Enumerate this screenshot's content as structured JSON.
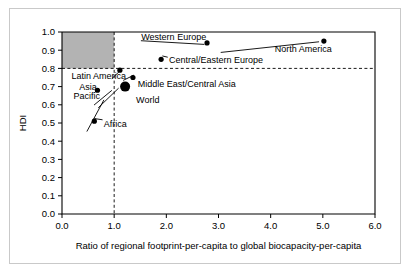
{
  "chart_data": {
    "type": "scatter",
    "title": "",
    "xlabel": "Ratio of regional footprint-per-capita to global biocapacity-per-capita",
    "ylabel": "HDI",
    "xlim": [
      0.0,
      6.0
    ],
    "ylim": [
      0.0,
      1.0
    ],
    "xticks": [
      "0.0",
      "1.0",
      "2.0",
      "3.0",
      "4.0",
      "5.0",
      "6.0"
    ],
    "xtick_values": [
      0.0,
      1.0,
      2.0,
      3.0,
      4.0,
      5.0,
      6.0
    ],
    "yticks": [
      "0.0",
      "0.1",
      "0.2",
      "0.3",
      "0.4",
      "0.5",
      "0.6",
      "0.7",
      "0.8",
      "0.9",
      "1.0"
    ],
    "ytick_values": [
      0.0,
      0.1,
      0.2,
      0.3,
      0.4,
      0.5,
      0.6,
      0.7,
      0.8,
      0.9,
      1.0
    ],
    "grid": false,
    "legend": "none",
    "annotations": {
      "shaded_region": {
        "name": "sustainable-development-quadrant",
        "x_range": [
          0.0,
          1.0
        ],
        "y_range": [
          0.8,
          1.0
        ],
        "color": "#b3b3b3"
      },
      "reference_lines": [
        {
          "name": "hdi-threshold",
          "orientation": "horizontal",
          "value": 0.8,
          "style": "dashed"
        },
        {
          "name": "biocapacity-threshold",
          "orientation": "vertical",
          "value": 1.0,
          "style": "dashed"
        }
      ]
    },
    "points": [
      {
        "label": "Africa",
        "x": 0.62,
        "y": 0.51,
        "size": "small"
      },
      {
        "label": "Asia Pacific",
        "x": 0.68,
        "y": 0.68,
        "size": "small"
      },
      {
        "label": "Latin America",
        "x": 1.11,
        "y": 0.79,
        "size": "small"
      },
      {
        "label": "World",
        "x": 1.21,
        "y": 0.7,
        "size": "large"
      },
      {
        "label": "Middle East/Central Asia",
        "x": 1.36,
        "y": 0.75,
        "size": "small"
      },
      {
        "label": "Central/Eastern Europe",
        "x": 1.9,
        "y": 0.85,
        "size": "small"
      },
      {
        "label": "Western Europe",
        "x": 2.78,
        "y": 0.94,
        "size": "small"
      },
      {
        "label": "North America",
        "x": 5.02,
        "y": 0.95,
        "size": "small"
      }
    ],
    "point_labels": [
      {
        "text": "Western Europe",
        "x": 1.52,
        "y": 0.975
      },
      {
        "text": "North America",
        "x": 4.08,
        "y": 0.905
      },
      {
        "text": "Central/Eastern Europe",
        "x": 2.05,
        "y": 0.845
      },
      {
        "text": "Latin America",
        "x": 0.18,
        "y": 0.757
      },
      {
        "text": "Middle East/Central Asia",
        "x": 1.45,
        "y": 0.718
      },
      {
        "text": "Asia",
        "x": 0.33,
        "y": 0.7
      },
      {
        "text": "Pacific",
        "x": 0.22,
        "y": 0.648
      },
      {
        "text": "World",
        "x": 1.42,
        "y": 0.628
      },
      {
        "text": "Africa",
        "x": 0.8,
        "y": 0.497
      }
    ]
  }
}
